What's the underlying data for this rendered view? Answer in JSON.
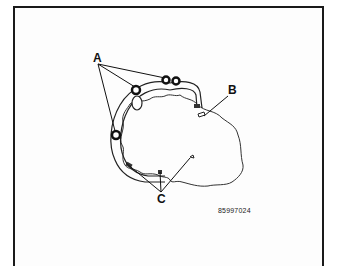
{
  "diagram": {
    "labels": {
      "a": "A",
      "b": "B",
      "c": "C"
    },
    "part_number": "85997024",
    "colors": {
      "line": "#1a1a1a",
      "background": "#fdfdfd"
    }
  }
}
